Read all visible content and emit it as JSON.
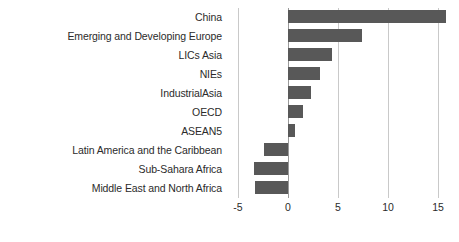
{
  "chart_data": {
    "type": "bar",
    "orientation": "horizontal",
    "title": "",
    "subtitle": "",
    "xlabel": "",
    "ylabel": "",
    "categories": [
      "China",
      "Emerging and Developing Europe",
      "LICs Asia",
      "NIEs",
      "IndustrialAsia",
      "OECD",
      "ASEAN5",
      "Latin America and the Caribbean",
      "Sub-Sahara Africa",
      "Middle East and North Africa"
    ],
    "values": [
      15.8,
      7.4,
      4.4,
      3.2,
      2.3,
      1.5,
      0.7,
      -2.4,
      -3.4,
      -3.3
    ],
    "xlim": [
      -5.6,
      16.4
    ],
    "xticks": [
      -5,
      0,
      5,
      10,
      15
    ],
    "xtick_labels": [
      "-5",
      "0",
      "5",
      "10",
      "15"
    ],
    "grid": true,
    "grid_axis": "x",
    "legend": false,
    "bar_color": "#585858",
    "gridline_color": "#c9c9c9",
    "zero_line_color": "#9a9a9a",
    "background_color": "#ffffff",
    "text_color": "#2b2b2b"
  }
}
